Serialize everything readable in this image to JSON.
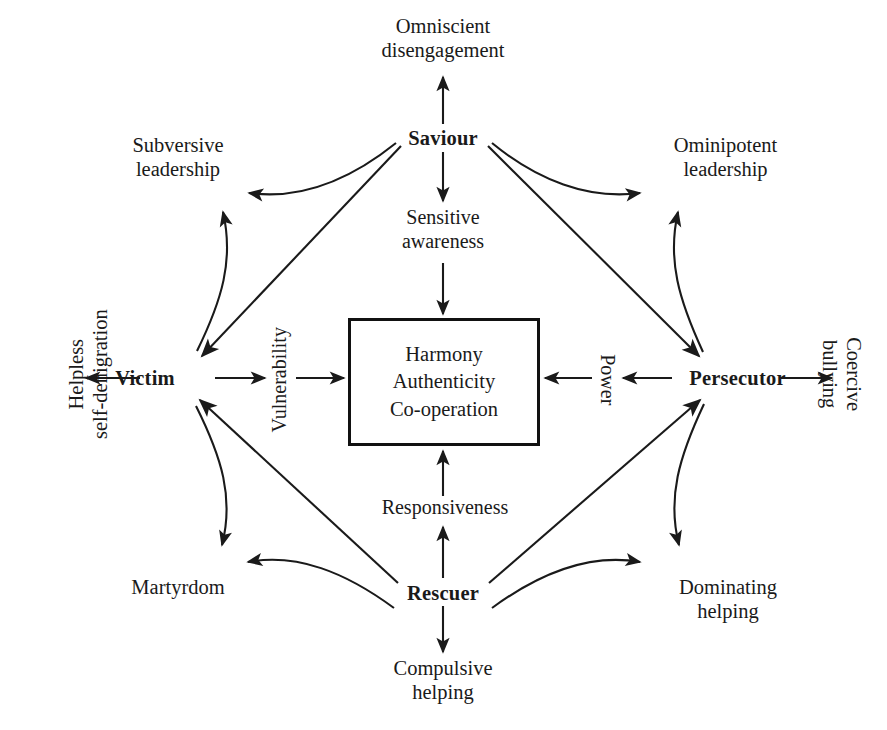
{
  "diagram": {
    "type": "relationship-role-diagram",
    "stroke_color": "#1a1a1a",
    "background_color": "#ffffff",
    "center": {
      "label": "Harmony\nAuthenticity\nCo-operation",
      "lines": [
        "Harmony",
        "Authenticity",
        "Co-operation"
      ]
    },
    "roles": {
      "saviour": "Saviour",
      "victim": "Victim",
      "persecutor": "Persecutor",
      "rescuer": "Rescuer"
    },
    "qualities": {
      "sensitive_awareness": "Sensitive\nawareness",
      "vulnerability": "Vulnerability",
      "power": "Power",
      "responsiveness": "Responsiveness"
    },
    "outcomes": {
      "omniscient_disengagement": "Omniscient\ndisengagement",
      "subversive_leadership": "Subversive\nleadership",
      "ominipotent_leadership": "Ominipotent\nleadership",
      "helpless_self_denigration": "Helpless\nself-denigration",
      "coercive_bullying": "Coercive\nbullying",
      "martyrdom": "Martyrdom",
      "dominating_helping": "Dominating\nhelping",
      "compulsive_helping": "Compulsive\nhelping"
    },
    "edges": [
      {
        "from": "Saviour",
        "to": "Omniscient disengagement",
        "style": "straight",
        "direction": "up"
      },
      {
        "from": "Saviour",
        "to": "Sensitive awareness",
        "style": "straight",
        "direction": "down"
      },
      {
        "from": "Sensitive awareness",
        "to": "Harmony Authenticity Co-operation",
        "style": "straight",
        "direction": "down"
      },
      {
        "from": "Victim",
        "to": "Helpless self-denigration",
        "style": "straight",
        "direction": "left"
      },
      {
        "from": "Victim",
        "to": "Vulnerability",
        "style": "straight",
        "direction": "right"
      },
      {
        "from": "Vulnerability",
        "to": "Harmony Authenticity Co-operation",
        "style": "straight",
        "direction": "right"
      },
      {
        "from": "Persecutor",
        "to": "Coercive bullying",
        "style": "straight",
        "direction": "right"
      },
      {
        "from": "Persecutor",
        "to": "Power",
        "style": "straight",
        "direction": "left"
      },
      {
        "from": "Power",
        "to": "Harmony Authenticity Co-operation",
        "style": "straight",
        "direction": "left"
      },
      {
        "from": "Rescuer",
        "to": "Compulsive helping",
        "style": "straight",
        "direction": "down"
      },
      {
        "from": "Rescuer",
        "to": "Responsiveness",
        "style": "straight",
        "direction": "up"
      },
      {
        "from": "Responsiveness",
        "to": "Harmony Authenticity Co-operation",
        "style": "straight",
        "direction": "up"
      },
      {
        "from": "Saviour",
        "to": "Victim",
        "style": "diagonal",
        "direction": "down-left"
      },
      {
        "from": "Saviour",
        "to": "Persecutor",
        "style": "diagonal",
        "direction": "down-right"
      },
      {
        "from": "Rescuer",
        "to": "Victim",
        "style": "diagonal",
        "direction": "up-left"
      },
      {
        "from": "Rescuer",
        "to": "Persecutor",
        "style": "diagonal",
        "direction": "up-right"
      },
      {
        "from": "Saviour",
        "to": "Subversive leadership",
        "style": "curved"
      },
      {
        "from": "Victim",
        "to": "Subversive leadership",
        "style": "curved"
      },
      {
        "from": "Saviour",
        "to": "Ominipotent leadership",
        "style": "curved"
      },
      {
        "from": "Persecutor",
        "to": "Ominipotent leadership",
        "style": "curved"
      },
      {
        "from": "Victim",
        "to": "Martyrdom",
        "style": "curved"
      },
      {
        "from": "Rescuer",
        "to": "Martyrdom",
        "style": "curved"
      },
      {
        "from": "Persecutor",
        "to": "Dominating helping",
        "style": "curved"
      },
      {
        "from": "Rescuer",
        "to": "Dominating helping",
        "style": "curved"
      }
    ]
  }
}
